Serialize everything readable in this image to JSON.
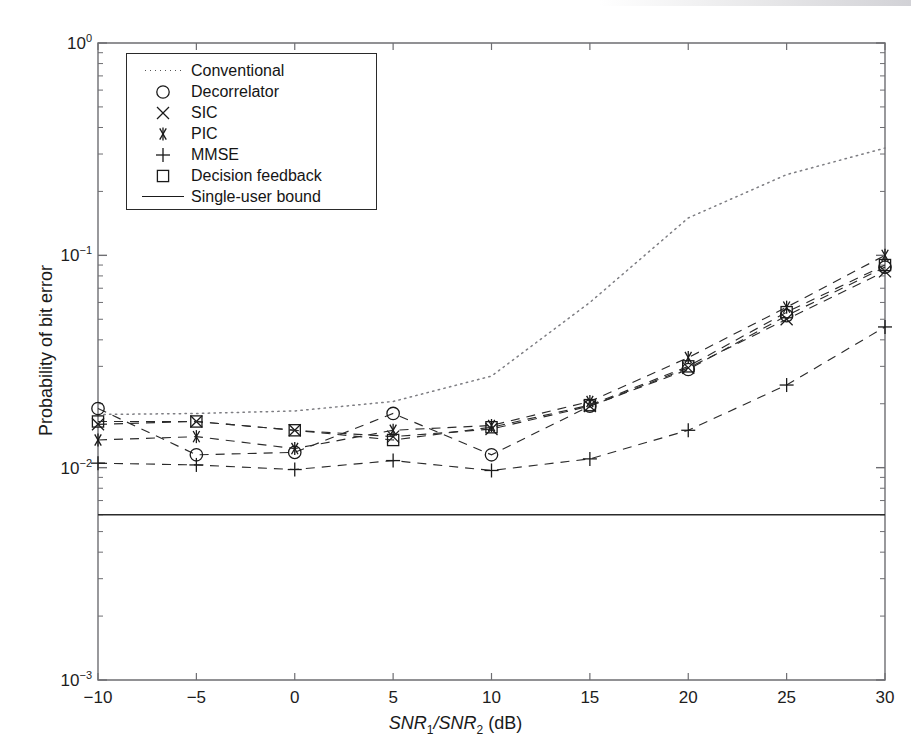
{
  "figure": {
    "domain": "chart",
    "background": "#ffffff",
    "ink_color": "#1a1a1a"
  },
  "axes": {
    "x_label_parts": {
      "snr1": "SNR",
      "sub1": "1",
      "slash": "/",
      "snr2": "SNR",
      "sub2": "2",
      "unit": " (dB)"
    },
    "y_label": "Probability of bit error",
    "x_ticks": [
      "-10",
      "-5",
      "0",
      "5",
      "10",
      "15",
      "20",
      "25",
      "30"
    ],
    "y_ticks": [
      {
        "mantissa": "10",
        "exponent": "0"
      },
      {
        "mantissa": "10",
        "exponent": "-1"
      },
      {
        "mantissa": "10",
        "exponent": "-2"
      },
      {
        "mantissa": "10",
        "exponent": "-3"
      }
    ]
  },
  "legend": {
    "position": "upper-left-inside",
    "entries": [
      {
        "label": "Conventional",
        "marker": "dotted-line",
        "glyph": ""
      },
      {
        "label": "Decorrelator",
        "marker": "circle",
        "glyph": "○"
      },
      {
        "label": "SIC",
        "marker": "x-cross",
        "glyph": "×"
      },
      {
        "label": "PIC",
        "marker": "asterisk",
        "glyph": "✳"
      },
      {
        "label": "MMSE",
        "marker": "plus",
        "glyph": "+"
      },
      {
        "label": "Decision feedback",
        "marker": "square",
        "glyph": "□"
      },
      {
        "label": "Single-user bound",
        "marker": "solid-line",
        "glyph": ""
      }
    ]
  },
  "chart_data": {
    "type": "line",
    "title": "",
    "xlabel": "SNR1/SNR2 (dB)",
    "ylabel": "Probability of bit error",
    "yscale": "log",
    "xlim": [
      -10,
      30
    ],
    "ylim": [
      0.001,
      1
    ],
    "grid": false,
    "legend_position": "upper left",
    "x": [
      -10,
      -5,
      0,
      5,
      10,
      15,
      20,
      25,
      30
    ],
    "series": [
      {
        "name": "Conventional",
        "marker": "none",
        "linestyle": "dotted",
        "values": [
          0.0178,
          0.018,
          0.0185,
          0.0205,
          0.027,
          0.06,
          0.15,
          0.24,
          0.32
        ]
      },
      {
        "name": "Decorrelator",
        "marker": "circle",
        "linestyle": "dashed",
        "values": [
          0.019,
          0.0115,
          0.0118,
          0.018,
          0.0115,
          0.0195,
          0.029,
          0.052,
          0.088
        ]
      },
      {
        "name": "SIC",
        "marker": "x-cross",
        "linestyle": "dashed",
        "values": [
          0.016,
          0.0165,
          0.015,
          0.014,
          0.0152,
          0.0195,
          0.0295,
          0.05,
          0.084
        ]
      },
      {
        "name": "PIC",
        "marker": "asterisk",
        "linestyle": "dashed",
        "values": [
          0.0135,
          0.014,
          0.0123,
          0.015,
          0.0158,
          0.0205,
          0.033,
          0.057,
          0.1
        ]
      },
      {
        "name": "MMSE",
        "marker": "plus",
        "linestyle": "dashed",
        "values": [
          0.0105,
          0.0103,
          0.0098,
          0.0108,
          0.0097,
          0.011,
          0.015,
          0.0245,
          0.046
        ]
      },
      {
        "name": "Decision feedback",
        "marker": "square",
        "linestyle": "dashed",
        "values": [
          0.0165,
          0.0165,
          0.015,
          0.0135,
          0.0155,
          0.0197,
          0.03,
          0.054,
          0.09
        ]
      },
      {
        "name": "Single-user bound",
        "marker": "none",
        "linestyle": "solid",
        "constant": 0.006,
        "values": [
          0.006,
          0.006,
          0.006,
          0.006,
          0.006,
          0.006,
          0.006,
          0.006,
          0.006
        ]
      }
    ]
  }
}
